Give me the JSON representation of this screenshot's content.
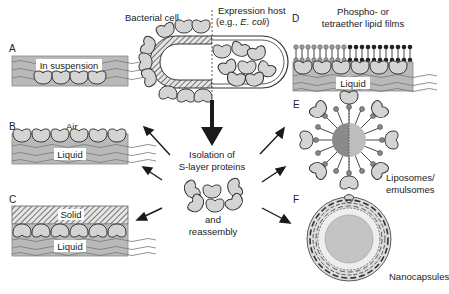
{
  "figure": {
    "center": {
      "title_line1": "Isolation of",
      "title_line2": "S-layer proteins",
      "sub_line1": "and",
      "sub_line2": "reassembly"
    },
    "top": {
      "bacterial_cell": "Bacterial cell",
      "expression_host_line1": "Expression host",
      "expression_host_line2_prefix": "(e.g., ",
      "expression_host_line2_italic": "E. coli",
      "expression_host_line2_suffix": ")"
    },
    "panels": {
      "A": {
        "letter": "A",
        "label": "In suspension"
      },
      "B": {
        "letter": "B",
        "top_label": "Air",
        "label": "Liquid"
      },
      "C": {
        "letter": "C",
        "top_label": "Solid",
        "label": "Liquid"
      },
      "D": {
        "letter": "D",
        "title_line1": "Phospho- or",
        "title_line2": "tetraether lipid films",
        "label": "Liquid"
      },
      "E": {
        "letter": "E",
        "caption_line1": "Liposomes/",
        "caption_line2": "emulsomes"
      },
      "F": {
        "letter": "F",
        "caption": "Nanocapsules"
      }
    },
    "colors": {
      "liquid": "#b9b9b9",
      "protein": "#d4d4d4",
      "outline": "#333333",
      "core_dark": "#8a8a8a",
      "core_light": "#bdbdbd"
    }
  }
}
